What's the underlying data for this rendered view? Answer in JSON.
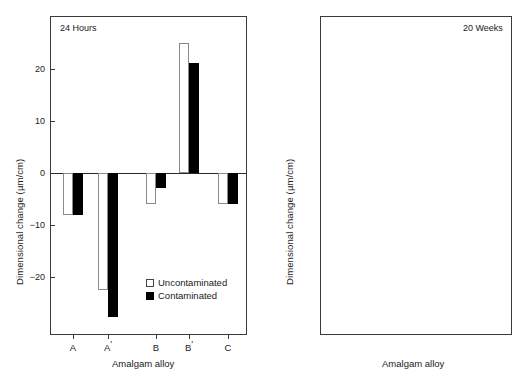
{
  "figure": {
    "ylabel": "Dimensional change (µm/cm)",
    "xlabel": "Amalgam alloy",
    "legend": {
      "uncontaminated": "Uncontaminated",
      "contaminated": "Contaminated",
      "uncontaminated_color": "#ffffff",
      "contaminated_color": "#000000"
    }
  },
  "panels": {
    "left": {
      "caption": "24 Hours"
    },
    "right": {
      "caption": "20 Weeks"
    }
  },
  "chart_data": [
    {
      "type": "bar",
      "title": "24 Hours",
      "xlabel": "Amalgam alloy",
      "ylabel": "Dimensional change (µm/cm)",
      "categories": [
        "A",
        "A'",
        "B",
        "B'",
        "C"
      ],
      "series": [
        {
          "name": "Uncontaminated",
          "color": "#ffffff",
          "values": [
            -8,
            -22.5,
            -6,
            25,
            -6
          ]
        },
        {
          "name": "Contaminated",
          "color": "#000000",
          "values": [
            -8,
            -27.5,
            -2.8,
            21,
            -6
          ]
        }
      ],
      "yticks": [
        -20,
        -10,
        0,
        10,
        20
      ],
      "ytick_labels": [
        "−20",
        "−10",
        "0",
        "10",
        "20"
      ],
      "ylim": [
        -30,
        26
      ],
      "grid": false,
      "legend_position": "inside bottom-right",
      "zero_line": true
    },
    {
      "type": "bar",
      "title": "20 Weeks",
      "xlabel": "Amalgam alloy",
      "ylabel": "Dimensional change (µm/cm)",
      "categories": [
        "A",
        "A'",
        "B",
        "B'",
        "C"
      ],
      "series": [
        {
          "name": "Uncontaminated",
          "color": "#ffffff",
          "values": [
            80,
            37,
            8,
            6,
            8
          ]
        },
        {
          "name": "Contaminated",
          "color": "#000000",
          "values": [
            640,
            71,
            91,
            3,
            6
          ]
        }
      ],
      "yticks": [
        0,
        20,
        40,
        60,
        80,
        100,
        200,
        300,
        400,
        500,
        600,
        700
      ],
      "ytick_labels": [
        "0",
        "20",
        "40",
        "60",
        "80",
        "100",
        "200",
        "300",
        "400",
        "500",
        "600",
        "700"
      ],
      "ylim": [
        0,
        740
      ],
      "axis_break": {
        "between": [
          100,
          200
        ],
        "at_tick_index": 7
      },
      "grid": false,
      "legend_position": "inside top-right"
    }
  ]
}
